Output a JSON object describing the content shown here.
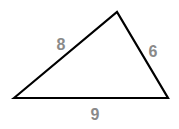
{
  "diagram": {
    "type": "triangle",
    "vertices": [
      [
        14,
        98
      ],
      [
        117,
        12
      ],
      [
        168,
        98
      ]
    ],
    "stroke_color": "#000000",
    "label_color": "#8a8a8a",
    "sides": [
      {
        "name": "left",
        "label": "8",
        "x": 61,
        "y": 45
      },
      {
        "name": "right",
        "label": "6",
        "x": 153,
        "y": 52
      },
      {
        "name": "bottom",
        "label": "9",
        "x": 95,
        "y": 115
      }
    ]
  }
}
